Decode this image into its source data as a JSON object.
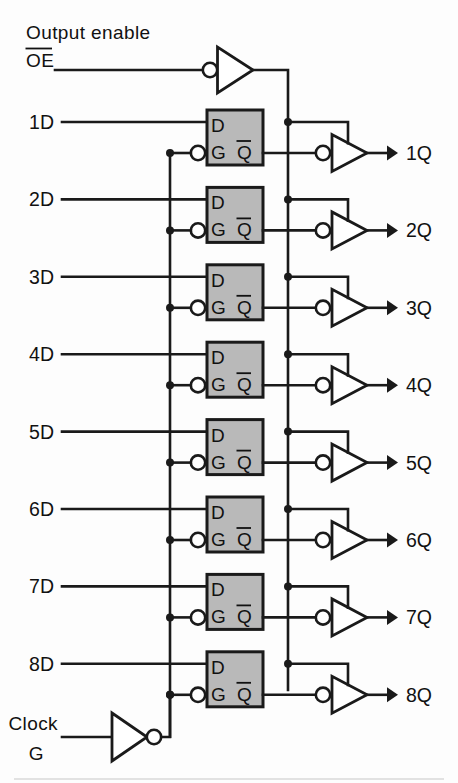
{
  "diagram": {
    "title": "Octal transparent latch with three-state outputs",
    "control": {
      "output_enable_label": "Output enable",
      "output_enable_pin": "OE",
      "output_enable_overbar": true,
      "clock_label": "Clock",
      "clock_pin": "G"
    },
    "latch_pins": {
      "data_in": "D",
      "gate_in": "G",
      "q_out": "Q",
      "q_out_overbar": true
    },
    "stages": [
      {
        "input": "1D",
        "output": "1Q"
      },
      {
        "input": "2D",
        "output": "2Q"
      },
      {
        "input": "3D",
        "output": "3Q"
      },
      {
        "input": "4D",
        "output": "4Q"
      },
      {
        "input": "5D",
        "output": "5Q"
      },
      {
        "input": "6D",
        "output": "6Q"
      },
      {
        "input": "7D",
        "output": "7Q"
      },
      {
        "input": "8D",
        "output": "8Q"
      }
    ],
    "colors": {
      "ink": "#1a1a1a",
      "latch_fill": "#b9b9b9",
      "background": "#fdfdfd",
      "gate_fill": "#ffffff"
    },
    "geometry": {
      "stage_pitch": 77.4,
      "first_d_y": 122,
      "first_q_y": 153,
      "box_left": 207,
      "box_right": 263,
      "box_top": 110,
      "box_height": 55,
      "gate_bus_x": 170,
      "oe_bus_x": 288,
      "buffer_left": 332,
      "buffer_right": 367,
      "output_arrow_x": 398
    }
  }
}
